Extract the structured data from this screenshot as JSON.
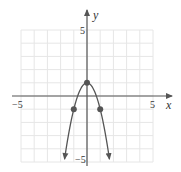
{
  "chart_data": {
    "type": "line",
    "title": "",
    "xlabel": "x",
    "ylabel": "y",
    "xlim": [
      -5,
      5
    ],
    "ylim": [
      -5,
      5
    ],
    "grid": true,
    "x_tick_labels": [
      "-5",
      "5"
    ],
    "y_tick_labels": [
      "5",
      "-5"
    ],
    "series": [
      {
        "name": "y = 1 - 2x^2",
        "equation": "y = 1 - 2x^2",
        "curve": "parabola opening downward, arrows at both ends",
        "x": [
          -1.7,
          -1.5,
          -1,
          -0.5,
          0,
          0.5,
          1,
          1.5,
          1.7
        ],
        "y": [
          -4.78,
          -3.5,
          -1,
          0.5,
          1,
          0.5,
          -1,
          -3.5,
          -4.78
        ]
      }
    ],
    "marked_points": [
      {
        "x": -1,
        "y": -1
      },
      {
        "x": 0,
        "y": 1
      },
      {
        "x": 1,
        "y": -1
      }
    ],
    "colors": {
      "curve": "#555555",
      "axis": "#555555",
      "grid": "#e6e6e6",
      "points": "#555555"
    }
  },
  "labels": {
    "x_axis": "x",
    "y_axis": "y",
    "x_min": "−5",
    "x_max": "5",
    "y_max": "5",
    "y_min": "−5"
  }
}
